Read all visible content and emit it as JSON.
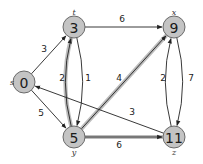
{
  "diagram": {
    "type": "weighted directed graph (shortest paths)",
    "colors": {
      "node_fill": "#c4c4c4",
      "node_stroke": "#6a6a6a",
      "edge": "#222222",
      "shade": "#bdbdbd"
    },
    "nodes": [
      {
        "id": "s",
        "name": "s",
        "value": "0",
        "cx": 24,
        "cy": 82,
        "name_dx": -12,
        "name_dy": 0
      },
      {
        "id": "t",
        "name": "t",
        "value": "3",
        "cx": 74,
        "cy": 27,
        "name_dx": 0,
        "name_dy": -15
      },
      {
        "id": "x",
        "name": "x",
        "value": "9",
        "cx": 174,
        "cy": 27,
        "name_dx": 0,
        "name_dy": -15
      },
      {
        "id": "y",
        "name": "y",
        "value": "5",
        "cx": 74,
        "cy": 137,
        "name_dx": 0,
        "name_dy": 15
      },
      {
        "id": "z",
        "name": "z",
        "value": "11",
        "cx": 174,
        "cy": 137,
        "name_dx": 0,
        "name_dy": 15
      }
    ],
    "edges": [
      {
        "from": "s",
        "to": "t",
        "weight": "3",
        "shaded": false,
        "curve": 0,
        "lx": 44,
        "ly": 49
      },
      {
        "from": "s",
        "to": "y",
        "weight": "5",
        "shaded": false,
        "curve": 0,
        "lx": 41,
        "ly": 113
      },
      {
        "from": "t",
        "to": "x",
        "weight": "6",
        "shaded": false,
        "curve": 0,
        "lx": 122,
        "ly": 19
      },
      {
        "from": "t",
        "to": "y",
        "weight": "2",
        "shaded": false,
        "curve": -9,
        "lx": 62,
        "ly": 78
      },
      {
        "from": "y",
        "to": "t",
        "weight": "1",
        "shaded": true,
        "curve": -9,
        "lx": 88,
        "ly": 78
      },
      {
        "from": "y",
        "to": "x",
        "weight": "4",
        "shaded": true,
        "curve": 0,
        "lx": 119,
        "ly": 78
      },
      {
        "from": "y",
        "to": "z",
        "weight": "6",
        "shaded": true,
        "curve": 0,
        "lx": 119,
        "ly": 145
      },
      {
        "from": "x",
        "to": "z",
        "weight": "2",
        "shaded": false,
        "curve": -9,
        "lx": 163,
        "ly": 78
      },
      {
        "from": "z",
        "to": "x",
        "weight": "7",
        "shaded": false,
        "curve": -9,
        "lx": 191,
        "ly": 78
      },
      {
        "from": "z",
        "to": "s",
        "weight": "3",
        "shaded": false,
        "curve": 0,
        "lx": 132,
        "ly": 112
      }
    ]
  }
}
